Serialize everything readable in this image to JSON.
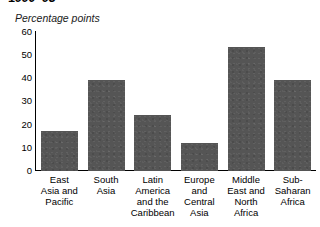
{
  "chart_data": {
    "type": "bar",
    "title": "1990–93",
    "subtitle": "",
    "xlabel": "",
    "ylabel": "Percentage points",
    "ylim": [
      0,
      60
    ],
    "yticks": [
      60,
      50,
      40,
      30,
      20,
      10,
      0
    ],
    "grid": false,
    "legend": null,
    "bar_color": "#555555",
    "axis_color": "#000000",
    "categories": [
      "East Asia and Pacific",
      "South Asia",
      "Latin America and the Caribbean",
      "Europe and Central Asia",
      "Middle East and North Africa",
      "Sub-Saharan Africa"
    ],
    "category_lines": [
      [
        "East",
        "Asia and",
        "Pacific"
      ],
      [
        "South",
        "Asia"
      ],
      [
        "Latin",
        "America",
        "and the",
        "Caribbean"
      ],
      [
        "Europe",
        "and",
        "Central",
        "Asia"
      ],
      [
        "Middle",
        "East and",
        "North",
        "Africa"
      ],
      [
        "Sub-",
        "Saharan",
        "Africa"
      ]
    ],
    "values": [
      17,
      39,
      24,
      12,
      53,
      39
    ]
  }
}
